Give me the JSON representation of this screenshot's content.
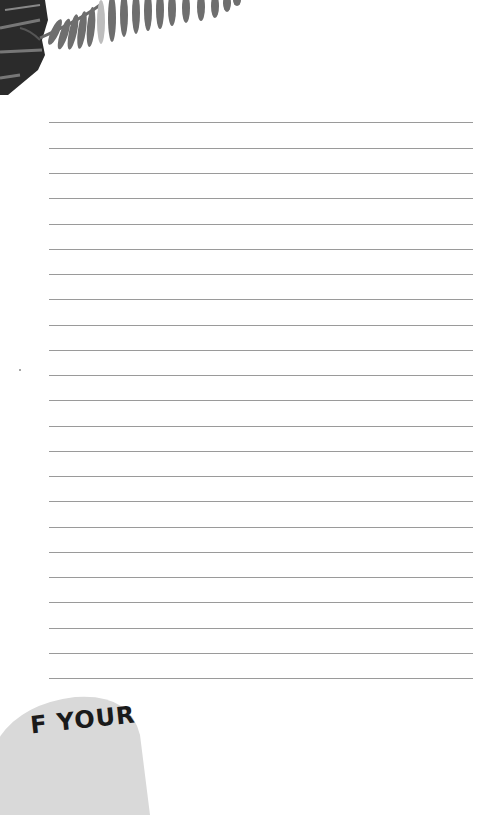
{
  "page": {
    "type": "lined notebook page",
    "line_count": 23,
    "line_color": "#9a9a9a",
    "line_start_y": 122,
    "line_spacing": 25.3
  },
  "decoration": {
    "top_left": "palm-leaf-illustration",
    "bottom_left_badge_text": "F YOUR",
    "badge_color": "#d9d9d9"
  }
}
